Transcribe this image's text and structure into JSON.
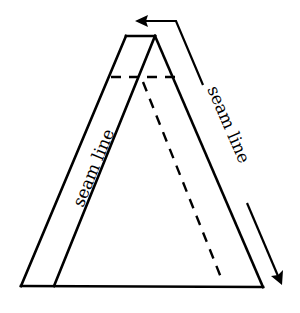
{
  "diagram": {
    "title": "",
    "labels": {
      "strip_label": "seam line",
      "arrow_label": "seam line"
    },
    "colors": {
      "stroke": "#000000",
      "background": "#ffffff"
    },
    "shapes": {
      "outer_strip_left_edge": {
        "from": [
          21,
          286
        ],
        "to": [
          126,
          36
        ]
      },
      "top_edge": {
        "from": [
          126,
          36
        ],
        "to": [
          155,
          36
        ]
      },
      "inner_strip_edge": {
        "from": [
          155,
          36
        ],
        "to": [
          54,
          286
        ]
      },
      "right_edge": {
        "from": [
          155,
          36
        ],
        "to": [
          263,
          287
        ]
      },
      "base": {
        "from": [
          21,
          286
        ],
        "to": [
          263,
          287
        ]
      },
      "dashed_horizontal": {
        "from": [
          111,
          77
        ],
        "to": [
          176,
          77
        ]
      },
      "dashed_diagonal": {
        "from": [
          143,
          80
        ],
        "to": [
          222,
          280
        ]
      },
      "arrow_path": {
        "start": [
          135,
          21
        ],
        "corner": [
          176,
          21
        ],
        "segment1_end": [
          203,
          85
        ],
        "segment2_start": [
          247,
          203
        ],
        "tip": [
          281,
          284
        ]
      }
    }
  }
}
